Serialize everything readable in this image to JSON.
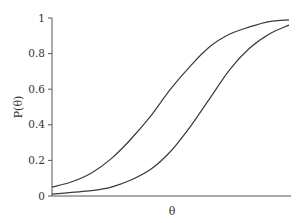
{
  "chart_data": {
    "type": "line",
    "title": "",
    "xlabel": "θ",
    "ylabel": "P(θ)",
    "ylim": [
      0,
      1
    ],
    "yticks": [
      "0",
      "0.2",
      "0.4",
      "0.6",
      "0.8",
      "1"
    ],
    "xticks": [],
    "grid": false,
    "legend": null,
    "x": [
      -3,
      -2.5,
      -2,
      -1.5,
      -1,
      -0.5,
      0,
      0.5,
      1,
      1.5,
      2,
      2.5,
      3
    ],
    "series": [
      {
        "name": "Item 1 (easier)",
        "values": [
          0.05,
          0.08,
          0.13,
          0.21,
          0.32,
          0.45,
          0.6,
          0.73,
          0.84,
          0.91,
          0.95,
          0.98,
          0.99
        ]
      },
      {
        "name": "Item 2 (harder)",
        "values": [
          0.01,
          0.02,
          0.03,
          0.05,
          0.09,
          0.15,
          0.25,
          0.39,
          0.55,
          0.71,
          0.83,
          0.91,
          0.96
        ]
      }
    ]
  }
}
